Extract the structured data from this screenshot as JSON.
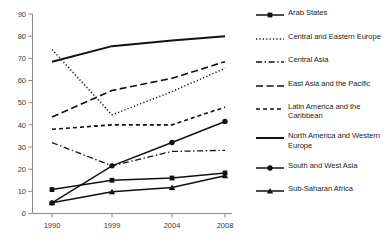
{
  "chart_data": {
    "type": "line",
    "title": "",
    "subtitle": "",
    "xlabel": "",
    "ylabel": "",
    "categories": [
      "1990",
      "1999",
      "2004",
      "2008"
    ],
    "x_tick_labels": [
      "1990",
      "1999",
      "2004",
      "2008"
    ],
    "y_tick_labels": [
      "0",
      "10",
      "20",
      "30",
      "40",
      "50",
      "60",
      "70",
      "80",
      "90"
    ],
    "y_ticks": [
      0,
      10,
      20,
      30,
      40,
      50,
      60,
      70,
      80,
      90
    ],
    "ylim": [
      0,
      90
    ],
    "grid": false,
    "legend_position": "right",
    "series": [
      {
        "name": "Arab States",
        "values": [
          10.8,
          15.0,
          16.0,
          18.3
        ],
        "line_style": "solid",
        "marker": "square",
        "color": "#111111"
      },
      {
        "name": "Central and Eastern Europe",
        "values": [
          74.0,
          44.5,
          55.0,
          65.5
        ],
        "line_style": "dotted",
        "marker": "none",
        "color": "#111111"
      },
      {
        "name": "Central Asia",
        "values": [
          32.0,
          21.5,
          28.0,
          28.5
        ],
        "line_style": "dashdot",
        "marker": "none",
        "color": "#111111"
      },
      {
        "name": "East Asia and the Pacific",
        "values": [
          43.5,
          55.5,
          61.0,
          68.5
        ],
        "line_style": "dashed-long",
        "marker": "none",
        "color": "#111111"
      },
      {
        "name": "Latin America and the Caribbean",
        "values": [
          38.0,
          40.0,
          40.0,
          48.0
        ],
        "line_style": "dashed-short",
        "marker": "none",
        "color": "#111111"
      },
      {
        "name": "North America and Western Europe",
        "values": [
          68.5,
          75.5,
          78.0,
          80.0
        ],
        "line_style": "solid-thick",
        "marker": "none",
        "color": "#111111"
      },
      {
        "name": "South and West Asia",
        "values": [
          4.8,
          21.5,
          32.0,
          41.5
        ],
        "line_style": "solid",
        "marker": "circle",
        "color": "#111111"
      },
      {
        "name": "Sub-Saharan Africa",
        "values": [
          4.8,
          9.8,
          11.7,
          17.0
        ],
        "line_style": "solid",
        "marker": "triangle",
        "color": "#111111"
      }
    ]
  },
  "legend": {
    "items": [
      {
        "label": "Arab States"
      },
      {
        "label": "Central and Eastern Europe"
      },
      {
        "label": "Central Asia"
      },
      {
        "label": "East Asia and the Pacific"
      },
      {
        "label": "Latin America and the Caribbean"
      },
      {
        "label": "North America and Western Europe"
      },
      {
        "label": "South and West Asia"
      },
      {
        "label": "Sub-Saharan Africa"
      }
    ]
  },
  "colors": {
    "ink": "#111111",
    "axis": "#8a8a8a",
    "tick_text": "#3a3a3a",
    "background": "#ffffff"
  }
}
